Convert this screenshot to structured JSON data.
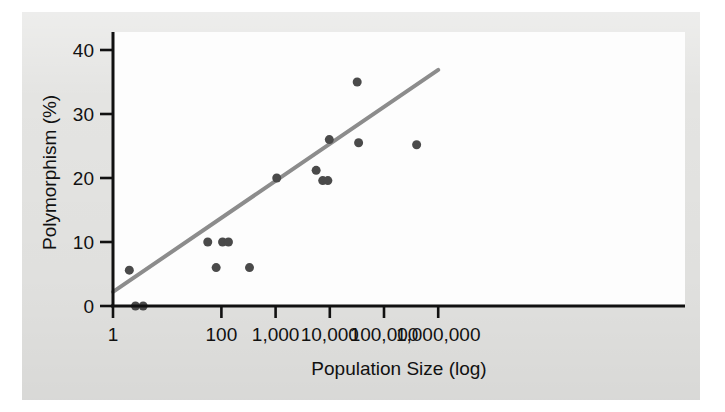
{
  "chart_data": {
    "type": "scatter",
    "title": "",
    "xlabel": "Population Size (log)",
    "ylabel": "Polymorphism (%)",
    "x_scale": "log",
    "xlim": [
      1,
      1000000
    ],
    "ylim": [
      0,
      43
    ],
    "grid": false,
    "legend": null,
    "xticks": [
      1,
      100,
      1000,
      10000,
      100000,
      1000000
    ],
    "xtick_labels": [
      "1",
      "100",
      "1,000",
      "10,000",
      "100,000",
      "1,000,000"
    ],
    "yticks": [
      0,
      10,
      20,
      30,
      40
    ],
    "ytick_labels": [
      "0",
      "10",
      "20",
      "30",
      "40"
    ],
    "marker_color": "#4a4a4a",
    "marker_size": 9,
    "points": [
      {
        "x": 2.0,
        "y": 5.6
      },
      {
        "x": 2.6,
        "y": 0.0
      },
      {
        "x": 3.6,
        "y": 0.0
      },
      {
        "x": 56,
        "y": 10.0
      },
      {
        "x": 80,
        "y": 6.0
      },
      {
        "x": 105,
        "y": 10.0
      },
      {
        "x": 135,
        "y": 10.0
      },
      {
        "x": 330,
        "y": 6.0
      },
      {
        "x": 1050,
        "y": 20.0
      },
      {
        "x": 5600,
        "y": 21.2
      },
      {
        "x": 7400,
        "y": 19.6
      },
      {
        "x": 9200,
        "y": 19.6
      },
      {
        "x": 9800,
        "y": 26.0
      },
      {
        "x": 32000,
        "y": 35.0
      },
      {
        "x": 34000,
        "y": 25.5
      },
      {
        "x": 400000,
        "y": 25.2
      }
    ],
    "trendline": {
      "type": "linear-on-log-x",
      "color": "#8c8c8c",
      "width": 4,
      "x_start": 1,
      "y_start": 2.2,
      "x_end": 1000000,
      "y_end": 36.9
    }
  },
  "axes": {
    "x_title": "Population Size (log)",
    "y_title": "Polymorphism (%)"
  },
  "colors": {
    "page_background": "#e4e4e2",
    "plot_background": "#fdfdfd",
    "axis": "#111111",
    "marker": "#4a4a4a",
    "trendline": "#8c8c8c"
  }
}
